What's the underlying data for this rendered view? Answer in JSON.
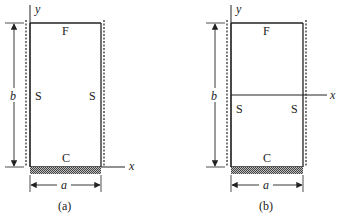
{
  "figures": [
    {
      "id": "a",
      "caption": "(a)",
      "axis_labels": {
        "x": "x",
        "y": "y"
      },
      "edge_labels": {
        "top": "F",
        "left": "S",
        "right": "S",
        "bottom": "C"
      },
      "dimensions": {
        "width": "a",
        "height": "b"
      },
      "x_axis_position": "bottom edge"
    },
    {
      "id": "b",
      "caption": "(b)",
      "axis_labels": {
        "x": "x",
        "y": "y"
      },
      "edge_labels": {
        "top": "F",
        "left": "S",
        "right": "S",
        "bottom": "C"
      },
      "dimensions": {
        "width": "a",
        "height": "b"
      },
      "x_axis_position": "mid-height"
    }
  ],
  "colors": {
    "line": "#222222",
    "hatch": "#555555",
    "background": "#ffffff"
  }
}
